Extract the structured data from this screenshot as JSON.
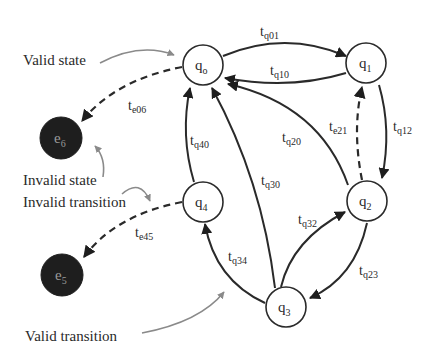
{
  "diagram": {
    "type": "state-transition-diagram",
    "colors": {
      "line": "#2a2a2a",
      "valid_state_fill": "#ffffff",
      "invalid_state_fill": "#1e1e1e",
      "annotation_arrow": "#8a8a8a"
    },
    "nodes": [
      {
        "id": "q0",
        "base": "q",
        "sub": "o",
        "kind": "valid",
        "x": 203,
        "y": 65
      },
      {
        "id": "q1",
        "base": "q",
        "sub": "1",
        "kind": "valid",
        "x": 366,
        "y": 63
      },
      {
        "id": "q2",
        "base": "q",
        "sub": "2",
        "kind": "valid",
        "x": 367,
        "y": 201
      },
      {
        "id": "q3",
        "base": "q",
        "sub": "3",
        "kind": "valid",
        "x": 286,
        "y": 307
      },
      {
        "id": "q4",
        "base": "q",
        "sub": "4",
        "kind": "valid",
        "x": 203,
        "y": 202
      },
      {
        "id": "e6",
        "base": "e",
        "sub": "6",
        "kind": "invalid",
        "x": 61,
        "y": 138
      },
      {
        "id": "e5",
        "base": "e",
        "sub": "5",
        "kind": "invalid",
        "x": 62,
        "y": 275
      }
    ],
    "edges": [
      {
        "id": "tq01",
        "from": "q0",
        "to": "q1",
        "base": "t",
        "sub": "q01",
        "style": "solid"
      },
      {
        "id": "tq10",
        "from": "q1",
        "to": "q0",
        "base": "t",
        "sub": "q10",
        "style": "solid"
      },
      {
        "id": "tq12",
        "from": "q1",
        "to": "q2",
        "base": "t",
        "sub": "q12",
        "style": "solid"
      },
      {
        "id": "te21",
        "from": "q2",
        "to": "q1",
        "base": "t",
        "sub": "e21",
        "style": "dashed"
      },
      {
        "id": "tq20",
        "from": "q2",
        "to": "q0",
        "base": "t",
        "sub": "q20",
        "style": "solid"
      },
      {
        "id": "tq23",
        "from": "q2",
        "to": "q3",
        "base": "t",
        "sub": "q23",
        "style": "solid"
      },
      {
        "id": "tq32",
        "from": "q3",
        "to": "q2",
        "base": "t",
        "sub": "q32",
        "style": "solid"
      },
      {
        "id": "tq30",
        "from": "q3",
        "to": "q0",
        "base": "t",
        "sub": "q30",
        "style": "solid"
      },
      {
        "id": "tq34",
        "from": "q3",
        "to": "q4",
        "base": "t",
        "sub": "q34",
        "style": "solid"
      },
      {
        "id": "tq40",
        "from": "q4",
        "to": "q0",
        "base": "t",
        "sub": "q40",
        "style": "solid"
      },
      {
        "id": "te06",
        "from": "q0",
        "to": "e6",
        "base": "t",
        "sub": "e06",
        "style": "dashed"
      },
      {
        "id": "te45",
        "from": "q4",
        "to": "e5",
        "base": "t",
        "sub": "e45",
        "style": "dashed"
      }
    ],
    "annotations": {
      "valid_state": "Valid state",
      "invalid_state": "Invalid state",
      "invalid_transition": "Invalid transition",
      "valid_transition": "Valid transition"
    }
  }
}
